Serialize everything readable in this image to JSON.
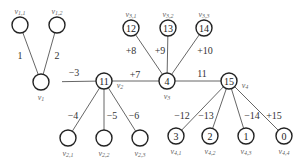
{
  "diagram": {
    "type": "weighted-tree",
    "nodes": [
      {
        "id": "v11",
        "label": "v1,1",
        "value": "",
        "x": 20,
        "y": 25,
        "label_pos": "top"
      },
      {
        "id": "v12",
        "label": "v1,2",
        "value": "",
        "x": 57,
        "y": 25,
        "label_pos": "top"
      },
      {
        "id": "v1",
        "label": "v1",
        "value": "",
        "x": 41,
        "y": 82,
        "label_pos": "bottom"
      },
      {
        "id": "v2",
        "label": "v2",
        "value": "11",
        "x": 104,
        "y": 81,
        "label_pos": "right"
      },
      {
        "id": "v21",
        "label": "v2,1",
        "value": "",
        "x": 68,
        "y": 138,
        "label_pos": "bottom"
      },
      {
        "id": "v22",
        "label": "v2,2",
        "value": "",
        "x": 104,
        "y": 138,
        "label_pos": "bottom"
      },
      {
        "id": "v23",
        "label": "v2,3",
        "value": "",
        "x": 140,
        "y": 138,
        "label_pos": "bottom"
      },
      {
        "id": "v31",
        "label": "v3,1",
        "value": "12",
        "x": 131,
        "y": 28,
        "label_pos": "top"
      },
      {
        "id": "v32",
        "label": "v3,2",
        "value": "13",
        "x": 168,
        "y": 28,
        "label_pos": "top"
      },
      {
        "id": "v33",
        "label": "v3,3",
        "value": "14",
        "x": 204,
        "y": 28,
        "label_pos": "top"
      },
      {
        "id": "v3",
        "label": "v3",
        "value": "4",
        "x": 167,
        "y": 81,
        "label_pos": "bottom"
      },
      {
        "id": "v4",
        "label": "v4",
        "value": "15",
        "x": 229,
        "y": 81,
        "label_pos": "right"
      },
      {
        "id": "v41",
        "label": "v4,1",
        "value": "3",
        "x": 176,
        "y": 136,
        "label_pos": "bottom"
      },
      {
        "id": "v42",
        "label": "v4,2",
        "value": "2",
        "x": 210,
        "y": 136,
        "label_pos": "bottom"
      },
      {
        "id": "v43",
        "label": "v4,3",
        "value": "1",
        "x": 246,
        "y": 136,
        "label_pos": "bottom"
      },
      {
        "id": "v44",
        "label": "v4,4",
        "value": "0",
        "x": 284,
        "y": 136,
        "label_pos": "bottom"
      }
    ],
    "edges": [
      {
        "from": "v11",
        "to": "v1",
        "weight": "1",
        "lx": 20,
        "ly": 55
      },
      {
        "from": "v12",
        "to": "v1",
        "weight": "2",
        "lx": 57,
        "ly": 55
      },
      {
        "from": "v1",
        "to": "v2",
        "weight": "−3",
        "lx": 74,
        "ly": 72,
        "start_x": 62
      },
      {
        "from": "v2",
        "to": "v21",
        "weight": "−4",
        "lx": 73,
        "ly": 115
      },
      {
        "from": "v2",
        "to": "v22",
        "weight": "−5",
        "lx": 112,
        "ly": 115
      },
      {
        "from": "v2",
        "to": "v23",
        "weight": "−6",
        "lx": 134,
        "ly": 115
      },
      {
        "from": "v2",
        "to": "v3",
        "weight": "+7",
        "lx": 135,
        "ly": 74
      },
      {
        "from": "v31",
        "to": "v3",
        "weight": "+8",
        "lx": 131,
        "ly": 50
      },
      {
        "from": "v32",
        "to": "v3",
        "weight": "+9",
        "lx": 160,
        "ly": 50
      },
      {
        "from": "v33",
        "to": "v3",
        "weight": "+10",
        "lx": 205,
        "ly": 50
      },
      {
        "from": "v3",
        "to": "v4",
        "weight": "11",
        "lx": 202,
        "ly": 73
      },
      {
        "from": "v4",
        "to": "v41",
        "weight": "−12",
        "lx": 182,
        "ly": 115
      },
      {
        "from": "v4",
        "to": "v42",
        "weight": "−13",
        "lx": 206,
        "ly": 115
      },
      {
        "from": "v4",
        "to": "v43",
        "weight": "−14",
        "lx": 252,
        "ly": 115
      },
      {
        "from": "v4",
        "to": "v44",
        "weight": "+15",
        "lx": 274,
        "ly": 115
      }
    ]
  }
}
